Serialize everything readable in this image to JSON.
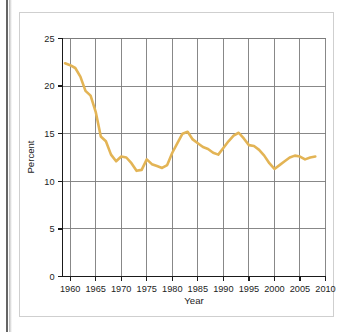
{
  "figure": {
    "background_color": "#ffffff",
    "border_color": "#cfcfcf"
  },
  "chart_data": {
    "type": "line",
    "title": "",
    "subtitle": "",
    "xlabel": "Year",
    "ylabel": "Percent",
    "xlim": [
      1958.5,
      2010
    ],
    "ylim": [
      0,
      25
    ],
    "xticks": [
      1960,
      1965,
      1970,
      1975,
      1980,
      1985,
      1990,
      1995,
      2000,
      2005,
      2010
    ],
    "xtick_labels": [
      "1960",
      "1965",
      "1970",
      "1975",
      "1980",
      "1985",
      "1990",
      "1995",
      "2000",
      "2005",
      "2010"
    ],
    "yticks": [
      0,
      5,
      10,
      15,
      20,
      25
    ],
    "ytick_labels": [
      "0",
      "5",
      "10",
      "15",
      "20",
      "25"
    ],
    "grid": "both",
    "grid_color": "#7b7b7b",
    "legend": "none",
    "annotations": [],
    "series": [
      {
        "name": "Percent",
        "color": "#e3b455",
        "line_width": 2.6,
        "x": [
          1959,
          1960,
          1961,
          1962,
          1963,
          1964,
          1965,
          1966,
          1967,
          1968,
          1969,
          1970,
          1971,
          1972,
          1973,
          1974,
          1975,
          1976,
          1977,
          1978,
          1979,
          1980,
          1981,
          1982,
          1983,
          1984,
          1985,
          1986,
          1987,
          1988,
          1989,
          1990,
          1991,
          1992,
          1993,
          1994,
          1995,
          1996,
          1997,
          1998,
          1999,
          2000,
          2001,
          2002,
          2003,
          2004,
          2005,
          2006,
          2007,
          2008
        ],
        "values": [
          22.4,
          22.2,
          21.9,
          21.0,
          19.5,
          19.0,
          17.3,
          14.7,
          14.2,
          12.8,
          12.1,
          12.6,
          12.5,
          11.9,
          11.1,
          11.2,
          12.3,
          11.8,
          11.6,
          11.4,
          11.7,
          13.0,
          14.0,
          15.0,
          15.2,
          14.4,
          14.0,
          13.6,
          13.4,
          13.0,
          12.8,
          13.5,
          14.2,
          14.8,
          15.1,
          14.5,
          13.8,
          13.7,
          13.3,
          12.7,
          11.9,
          11.3,
          11.7,
          12.1,
          12.5,
          12.7,
          12.6,
          12.3,
          12.5,
          12.6
        ]
      }
    ]
  },
  "axis": {
    "y_title": "Percent",
    "x_title": "Year"
  }
}
